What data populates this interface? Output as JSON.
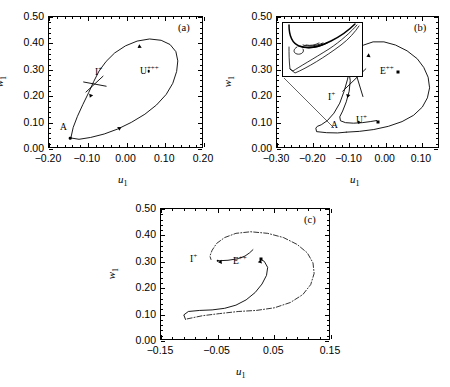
{
  "figure": {
    "caption_tags": [
      "(a)",
      "(b)",
      "(c)"
    ],
    "axis_x_name": "u",
    "axis_x_sub": "1",
    "axis_y_name": "w",
    "axis_y_sub": "1"
  },
  "chart_data": [
    {
      "type": "line",
      "panel": "(a)",
      "title": "",
      "xlabel": "u_1",
      "ylabel": "w_1",
      "xlim": [
        -0.2,
        0.2
      ],
      "ylim": [
        0.0,
        0.5
      ],
      "xticks": [
        -0.2,
        -0.1,
        0.0,
        0.1,
        0.2
      ],
      "xticklabels": [
        "-0.20",
        "-0.10",
        "0.00",
        "0.10",
        "0.20"
      ],
      "yticks": [
        0.0,
        0.1,
        0.2,
        0.3,
        0.4,
        0.5
      ],
      "yticklabels": [
        "0.00",
        "0.10",
        "0.20",
        "0.30",
        "0.40",
        "0.50"
      ],
      "grid": false,
      "legend": "none",
      "annotations": [
        {
          "text": "I+",
          "x": -0.082,
          "y": 0.283,
          "kind": "saddle-label"
        },
        {
          "text": "U+++",
          "x": 0.05,
          "y": 0.325,
          "kind": "equilibrium-label"
        },
        {
          "text": "A",
          "x": -0.162,
          "y": 0.082,
          "kind": "point-label"
        }
      ],
      "markers": [
        {
          "name": "U+++",
          "x": 0.06,
          "y": 0.29,
          "shape": "dot"
        },
        {
          "name": "A",
          "x": -0.142,
          "y": 0.038,
          "shape": "dot"
        }
      ],
      "series": [
        {
          "name": "homoclinic-orbit",
          "style": "solid",
          "points": [
            [
              -0.141,
              0.038
            ],
            [
              -0.12,
              0.033
            ],
            [
              -0.09,
              0.04
            ],
            [
              -0.055,
              0.053
            ],
            [
              -0.02,
              0.072
            ],
            [
              0.015,
              0.097
            ],
            [
              0.05,
              0.128
            ],
            [
              0.08,
              0.163
            ],
            [
              0.105,
              0.203
            ],
            [
              0.122,
              0.245
            ],
            [
              0.132,
              0.29
            ],
            [
              0.135,
              0.33
            ],
            [
              0.13,
              0.365
            ],
            [
              0.115,
              0.392
            ],
            [
              0.092,
              0.408
            ],
            [
              0.062,
              0.413
            ],
            [
              0.03,
              0.405
            ],
            [
              0.0,
              0.387
            ],
            [
              -0.028,
              0.36
            ],
            [
              -0.05,
              0.328
            ],
            [
              -0.068,
              0.292
            ],
            [
              -0.082,
              0.252
            ],
            [
              -0.095,
              0.21
            ],
            [
              -0.11,
              0.165
            ],
            [
              -0.124,
              0.12
            ],
            [
              -0.135,
              0.078
            ],
            [
              -0.141,
              0.038
            ]
          ]
        },
        {
          "name": "stable-manifold-segment",
          "style": "solid",
          "points": [
            [
              -0.108,
              0.25
            ],
            [
              -0.05,
              0.234
            ]
          ]
        },
        {
          "name": "unstable-manifold-segment",
          "style": "solid",
          "points": [
            [
              -0.102,
              0.212
            ],
            [
              -0.058,
              0.272
            ]
          ]
        }
      ],
      "flow_arrows": [
        {
          "x": 0.04,
          "y": 0.388,
          "angle": 215
        },
        {
          "x": -0.088,
          "y": 0.205,
          "angle": 248
        },
        {
          "x": -0.02,
          "y": 0.071,
          "angle": 30
        }
      ]
    },
    {
      "type": "line",
      "panel": "(b)",
      "title": "",
      "xlabel": "u_1",
      "ylabel": "w_1",
      "xlim": [
        -0.3,
        0.15
      ],
      "ylim": [
        0.0,
        0.5
      ],
      "xticks": [
        -0.3,
        -0.2,
        -0.1,
        0.0,
        0.1
      ],
      "xticklabels": [
        "-0.30",
        "-0.20",
        "-0.10",
        "0.00",
        "0.10"
      ],
      "yticks": [
        0.0,
        0.1,
        0.2,
        0.3,
        0.4,
        0.5
      ],
      "yticklabels": [
        "0.00",
        "0.10",
        "0.20",
        "0.30",
        "0.40",
        "0.50"
      ],
      "grid": false,
      "legend": "none",
      "annotations": [
        {
          "text": "I+",
          "x": -0.052,
          "y": 0.255,
          "kind": "saddle-label"
        },
        {
          "text": "E++",
          "x": 0.048,
          "y": 0.305,
          "kind": "equilibrium-label"
        },
        {
          "text": "U+",
          "x": -0.018,
          "y": 0.122,
          "kind": "equilibrium-label"
        },
        {
          "text": "A",
          "x": -0.062,
          "y": 0.108,
          "kind": "point-label"
        }
      ],
      "markers": [
        {
          "name": "E++",
          "x": 0.038,
          "y": 0.288,
          "shape": "square"
        },
        {
          "name": "U+",
          "x": -0.018,
          "y": 0.1,
          "shape": "square"
        },
        {
          "name": "A",
          "x": -0.072,
          "y": 0.098,
          "shape": "dot"
        }
      ],
      "series": [
        {
          "name": "outer-orbit",
          "style": "solid",
          "points": [
            [
              -0.106,
              0.06
            ],
            [
              -0.07,
              0.063
            ],
            [
              -0.03,
              0.07
            ],
            [
              0.01,
              0.082
            ],
            [
              0.048,
              0.1
            ],
            [
              0.08,
              0.124
            ],
            [
              0.104,
              0.155
            ],
            [
              0.118,
              0.19
            ],
            [
              0.124,
              0.228
            ],
            [
              0.12,
              0.268
            ],
            [
              0.108,
              0.305
            ],
            [
              0.09,
              0.338
            ],
            [
              0.062,
              0.368
            ],
            [
              0.03,
              0.39
            ],
            [
              -0.002,
              0.402
            ],
            [
              -0.032,
              0.402
            ],
            [
              -0.058,
              0.39
            ],
            [
              -0.076,
              0.368
            ],
            [
              -0.088,
              0.338
            ],
            [
              -0.096,
              0.3
            ],
            [
              -0.103,
              0.258
            ],
            [
              -0.112,
              0.215
            ],
            [
              -0.124,
              0.17
            ],
            [
              -0.14,
              0.132
            ],
            [
              -0.158,
              0.104
            ],
            [
              -0.175,
              0.088
            ],
            [
              -0.186,
              0.082
            ],
            [
              -0.19,
              0.075
            ],
            [
              -0.188,
              0.062
            ],
            [
              -0.16,
              0.058
            ],
            [
              -0.13,
              0.057
            ],
            [
              -0.106,
              0.06
            ]
          ]
        },
        {
          "name": "homoclinic-spiral",
          "style": "solid",
          "points": [
            [
              -0.1,
              0.3
            ],
            [
              -0.095,
              0.255
            ],
            [
              -0.098,
              0.215
            ],
            [
              -0.106,
              0.175
            ],
            [
              -0.116,
              0.14
            ],
            [
              -0.124,
              0.118
            ],
            [
              -0.122,
              0.103
            ],
            [
              -0.108,
              0.096
            ],
            [
              -0.086,
              0.094
            ],
            [
              -0.062,
              0.096
            ],
            [
              -0.04,
              0.1
            ],
            [
              -0.022,
              0.104
            ]
          ]
        },
        {
          "name": "stable-manifold-segment",
          "style": "solid",
          "points": [
            [
              -0.09,
              0.33
            ],
            [
              -0.06,
              0.195
            ]
          ]
        },
        {
          "name": "unstable-manifold-segment",
          "style": "solid",
          "points": [
            [
              -0.116,
              0.215
            ],
            [
              -0.052,
              0.3
            ]
          ]
        }
      ],
      "flow_arrows": [
        {
          "x": -0.04,
          "y": 0.352,
          "angle": 205
        },
        {
          "x": -0.1,
          "y": 0.205,
          "angle": 255
        }
      ],
      "inset": {
        "label": "magnified-spiral",
        "connector": true,
        "series": [
          {
            "name": "inner-spiral",
            "style": "solid"
          },
          {
            "name": "inner-loop",
            "style": "solid"
          }
        ]
      }
    },
    {
      "type": "line",
      "panel": "(c)",
      "title": "",
      "xlabel": "u_1",
      "ylabel": "w_1",
      "xlim": [
        -0.15,
        0.15
      ],
      "ylim": [
        0.0,
        0.5
      ],
      "xticks": [
        -0.15,
        -0.05,
        0.05,
        0.15
      ],
      "xticklabels": [
        "-0.15",
        "-0.05",
        "0.05",
        "0.15"
      ],
      "yticks": [
        0.0,
        0.1,
        0.2,
        0.3,
        0.4,
        0.5
      ],
      "yticklabels": [
        "0.00",
        "0.10",
        "0.20",
        "0.30",
        "0.40",
        "0.50"
      ],
      "grid": false,
      "legend": "none",
      "annotations": [
        {
          "text": "I+",
          "x": -0.052,
          "y": 0.338,
          "kind": "saddle-label"
        },
        {
          "text": "E++",
          "x": 0.03,
          "y": 0.33,
          "kind": "equilibrium-label"
        }
      ],
      "markers": [
        {
          "name": "I+",
          "x": -0.048,
          "y": 0.3,
          "shape": "dot"
        },
        {
          "name": "E++",
          "x": 0.028,
          "y": 0.305,
          "shape": "square"
        }
      ],
      "series": [
        {
          "name": "heteroclinic-connection",
          "style": "solid",
          "points": [
            [
              -0.105,
              0.078
            ],
            [
              -0.108,
              0.095
            ],
            [
              -0.1,
              0.108
            ],
            [
              -0.08,
              0.112
            ],
            [
              -0.058,
              0.114
            ],
            [
              -0.036,
              0.12
            ],
            [
              -0.016,
              0.132
            ],
            [
              0.002,
              0.152
            ],
            [
              0.018,
              0.18
            ],
            [
              0.03,
              0.212
            ],
            [
              0.038,
              0.245
            ],
            [
              0.04,
              0.275
            ],
            [
              0.034,
              0.298
            ],
            [
              0.028,
              0.305
            ]
          ]
        },
        {
          "name": "upper-branch",
          "style": "solid",
          "points": [
            [
              -0.048,
              0.3
            ],
            [
              -0.03,
              0.302
            ],
            [
              -0.012,
              0.308
            ],
            [
              0.0,
              0.318
            ],
            [
              0.008,
              0.33
            ],
            [
              0.014,
              0.342
            ]
          ]
        },
        {
          "name": "outer-periodic-orbit",
          "style": "dashdot",
          "points": [
            [
              -0.102,
              0.08
            ],
            [
              -0.075,
              0.092
            ],
            [
              -0.045,
              0.1
            ],
            [
              -0.012,
              0.108
            ],
            [
              0.02,
              0.112
            ],
            [
              0.052,
              0.122
            ],
            [
              0.08,
              0.142
            ],
            [
              0.102,
              0.172
            ],
            [
              0.116,
              0.21
            ],
            [
              0.122,
              0.252
            ],
            [
              0.12,
              0.292
            ],
            [
              0.11,
              0.33
            ],
            [
              0.092,
              0.362
            ],
            [
              0.068,
              0.388
            ],
            [
              0.04,
              0.404
            ],
            [
              0.01,
              0.41
            ],
            [
              -0.016,
              0.404
            ],
            [
              -0.036,
              0.388
            ],
            [
              -0.05,
              0.366
            ],
            [
              -0.058,
              0.34
            ],
            [
              -0.062,
              0.318
            ],
            [
              -0.06,
              0.305
            ]
          ]
        }
      ],
      "flow_arrows": [
        {
          "x": 0.026,
          "y": 0.29,
          "angle": 75
        },
        {
          "x": -0.04,
          "y": 0.296,
          "angle": 185
        }
      ]
    }
  ]
}
